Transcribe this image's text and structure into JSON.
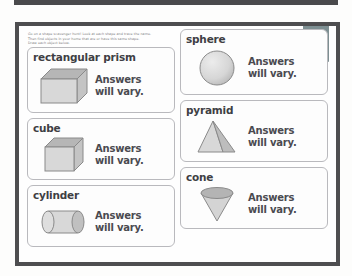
{
  "worksheet": {
    "instructions": [
      "Go on a shape scavenger hunt! Look at each shape and trace the name.",
      "Then find objects in your home that are or have this same shape.",
      "Draw each object below."
    ],
    "page_badge": {
      "number": "15",
      "category": "Shapes"
    },
    "answer_line_1": "Answers",
    "answer_line_2": "will vary.",
    "colors": {
      "page_frame": "#4e4e50",
      "ribbon": "#7d8f92",
      "card_border": "#b9b9bd",
      "label_text": "#3f3f44",
      "answer_text": "#4a4a50",
      "shape_fill": "#d8d8d8",
      "shape_shade": "#b6b6b6",
      "shape_stroke": "#8a8a8a"
    },
    "cards_left": [
      {
        "label": "rectangular prism",
        "shape": "rectangular-prism"
      },
      {
        "label": "cube",
        "shape": "cube"
      },
      {
        "label": "cylinder",
        "shape": "cylinder"
      }
    ],
    "cards_right": [
      {
        "label": "sphere",
        "shape": "sphere"
      },
      {
        "label": "pyramid",
        "shape": "pyramid"
      },
      {
        "label": "cone",
        "shape": "cone"
      }
    ]
  }
}
